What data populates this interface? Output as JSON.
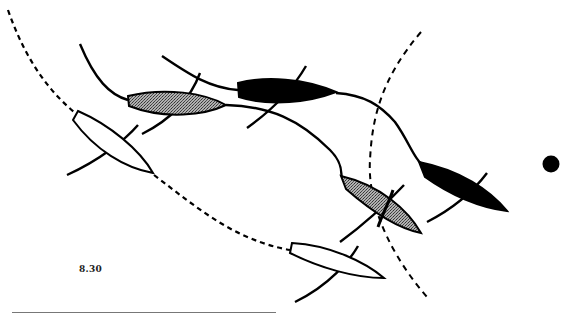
{
  "figure": {
    "label": "8.30",
    "colors": {
      "background": "#ffffff",
      "stroke": "#000000",
      "position_1_fill": "#ffffff",
      "position_2_fill": "#8a8a8a",
      "position_3_fill": "#000000",
      "rule": "#777777"
    },
    "mark": {
      "name": "mark-buoy",
      "cx": 551,
      "cy": 164,
      "r": 8
    },
    "boats": [
      {
        "id": "boat-a-pos1",
        "fill": "white",
        "bow": [
          152,
          173
        ],
        "stern": [
          76,
          113
        ]
      },
      {
        "id": "boat-a-pos2",
        "fill": "grey",
        "bow": [
          226,
          105
        ],
        "stern": [
          128,
          100
        ]
      },
      {
        "id": "boat-a-pos3",
        "fill": "black",
        "bow": [
          336,
          93
        ],
        "stern": [
          238,
          88
        ]
      },
      {
        "id": "boat-b-pos1",
        "fill": "white",
        "bow": [
          384,
          278
        ],
        "stern": [
          291,
          248
        ]
      },
      {
        "id": "boat-b-pos2",
        "fill": "grey",
        "bow": [
          421,
          233
        ],
        "stern": [
          342,
          177
        ]
      },
      {
        "id": "boat-b-pos3",
        "fill": "black",
        "bow": [
          507,
          211
        ],
        "stern": [
          421,
          163
        ]
      }
    ]
  }
}
